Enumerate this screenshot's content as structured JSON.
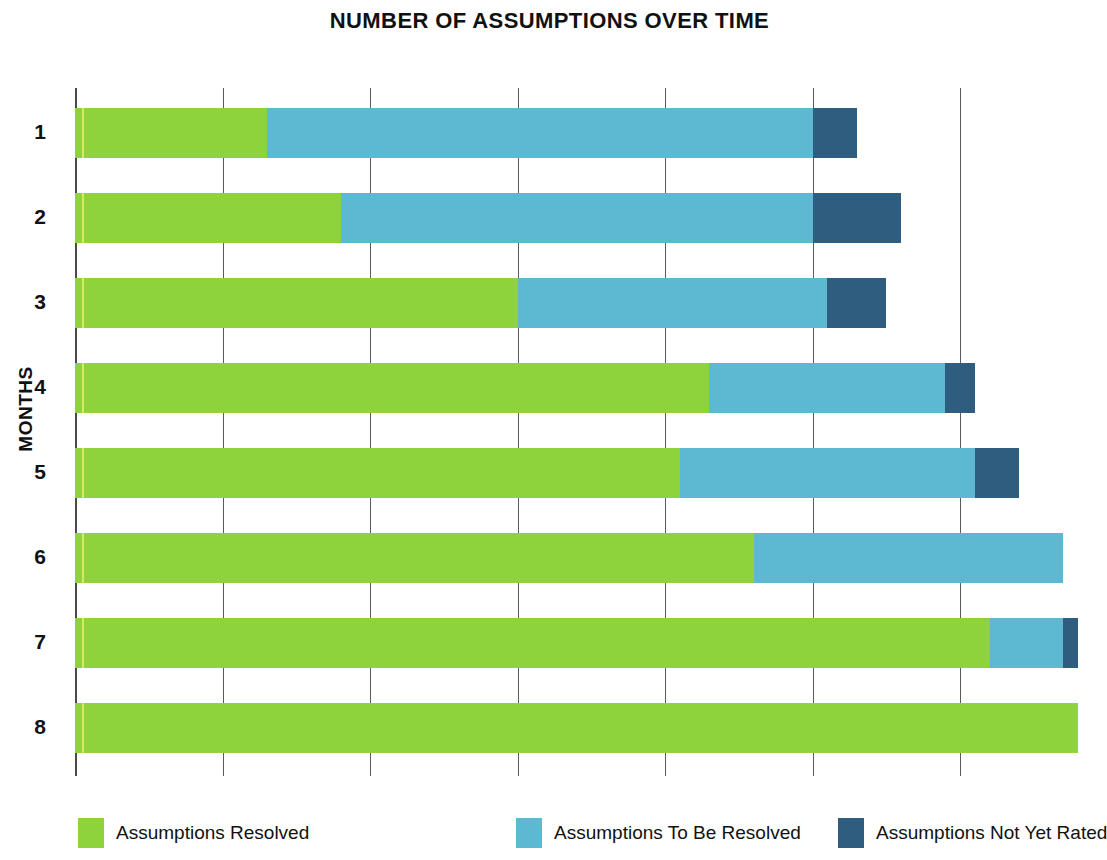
{
  "chart_data": {
    "type": "bar",
    "orientation": "horizontal",
    "stacked": true,
    "title": "NUMBER OF ASSUMPTIONS OVER TIME",
    "xlabel": "",
    "ylabel": "MONTHS",
    "categories": [
      "1",
      "2",
      "3",
      "4",
      "5",
      "6",
      "7",
      "8"
    ],
    "grid": true,
    "gridline_count": 7,
    "xlim": [
      0,
      70
    ],
    "xtick_labels_shown": false,
    "legend_position": "bottom",
    "colors": {
      "resolved": "#8ed23c",
      "to_be_resolved": "#5db8d2",
      "not_rated": "#2f5d7f",
      "gridline": "#5a5a5a",
      "text": "#111111",
      "background": "#ffffff"
    },
    "series": [
      {
        "name": "Assumptions Resolved",
        "color": "#8ed23c",
        "values": [
          13,
          18,
          30,
          43,
          41,
          46,
          62,
          68
        ]
      },
      {
        "name": "Assumptions To Be Resolved",
        "color": "#5db8d2",
        "values": [
          37,
          32,
          21,
          16,
          20,
          21,
          5,
          0
        ]
      },
      {
        "name": "Assumptions Not Yet Rated",
        "color": "#2f5d7f",
        "values": [
          3,
          6,
          4,
          2,
          3,
          0,
          1,
          0
        ]
      }
    ],
    "totals": [
      53,
      56,
      55,
      61,
      64,
      67,
      68,
      68
    ]
  },
  "legend": {
    "items": [
      {
        "label": "Assumptions Resolved",
        "swatch": "resolved"
      },
      {
        "label": "Assumptions To Be Resolved",
        "swatch": "to-be-resolved"
      },
      {
        "label": "Assumptions Not Yet Rated",
        "swatch": "not-rated"
      }
    ]
  }
}
